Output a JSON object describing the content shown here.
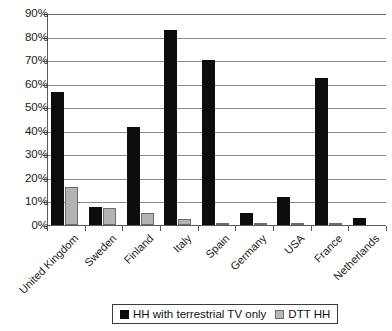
{
  "chart_data": {
    "type": "bar",
    "title": "",
    "xlabel": "",
    "ylabel": "",
    "ylim": [
      0,
      90
    ],
    "ytick_step": 10,
    "grid": true,
    "legend_position": "bottom-center",
    "categories": [
      "United Kingdom",
      "Sweden",
      "Finland",
      "Italy",
      "Spain",
      "Germany",
      "USA",
      "France",
      "Netherlands"
    ],
    "ytick_labels": [
      "0%",
      "10%",
      "20%",
      "30%",
      "40%",
      "50%",
      "60%",
      "70%",
      "80%",
      "90%"
    ],
    "ytick_values": [
      0,
      10,
      20,
      30,
      40,
      50,
      60,
      70,
      80,
      90
    ],
    "series": [
      {
        "name": "HH with terrestrial TV only",
        "color": "#0d0d0d",
        "values": [
          56.5,
          7.7,
          41.5,
          83.0,
          70.0,
          5.0,
          12.0,
          62.5,
          3.0
        ]
      },
      {
        "name": "DTT HH",
        "color": "#b3b3b3",
        "values": [
          16.0,
          7.3,
          5.0,
          2.5,
          1.0,
          0.6,
          0.6,
          0.8,
          0.0
        ]
      }
    ]
  },
  "legend": {
    "items": [
      {
        "label": "HH with terrestrial TV only",
        "swatch": "black-square-icon"
      },
      {
        "label": "DTT HH",
        "swatch": "gray-square-icon"
      }
    ]
  }
}
